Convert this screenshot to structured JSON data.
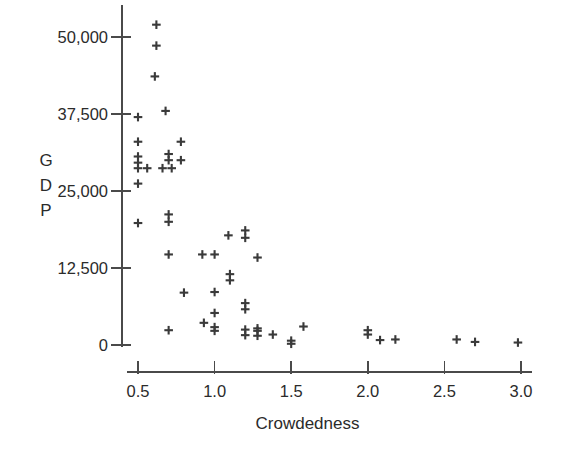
{
  "chart_data": {
    "type": "scatter",
    "title": "",
    "xlabel": "Crowdedness",
    "ylabel": "GDP",
    "ylabel_letters": [
      "G",
      "D",
      "P"
    ],
    "xlim": [
      0.44,
      3.06
    ],
    "ylim": [
      -1600,
      53500
    ],
    "xticks": [
      0.5,
      1.0,
      1.5,
      2.0,
      2.5,
      3.0
    ],
    "xtick_labels": [
      "0.5",
      "1.0",
      "1.5",
      "2.0",
      "2.5",
      "3.0"
    ],
    "yticks": [
      0,
      12500,
      25000,
      37500,
      50000
    ],
    "ytick_labels": [
      "0",
      "12,500",
      "25,000",
      "37,500",
      "50,000"
    ],
    "grid": false,
    "legend": false,
    "marker": "plus",
    "marker_color": "#3a3a3a",
    "axis_color": "#4a4a4a",
    "background": "#ffffff",
    "points": [
      [
        0.62,
        52000
      ],
      [
        0.62,
        48600
      ],
      [
        0.61,
        43600
      ],
      [
        0.5,
        37000
      ],
      [
        0.68,
        38000
      ],
      [
        0.5,
        33000
      ],
      [
        0.78,
        33000
      ],
      [
        0.5,
        30600
      ],
      [
        0.5,
        29600
      ],
      [
        0.7,
        31000
      ],
      [
        0.7,
        30000
      ],
      [
        0.78,
        30000
      ],
      [
        0.5,
        28700
      ],
      [
        0.56,
        28700
      ],
      [
        0.66,
        28700
      ],
      [
        0.72,
        28700
      ],
      [
        0.5,
        26200
      ],
      [
        0.5,
        19800
      ],
      [
        0.7,
        21200
      ],
      [
        0.7,
        20000
      ],
      [
        1.09,
        17800
      ],
      [
        1.2,
        18600
      ],
      [
        1.2,
        17400
      ],
      [
        0.7,
        14700
      ],
      [
        0.92,
        14700
      ],
      [
        1.0,
        14700
      ],
      [
        1.28,
        14200
      ],
      [
        1.1,
        11500
      ],
      [
        1.1,
        10500
      ],
      [
        0.8,
        8500
      ],
      [
        1.0,
        8600
      ],
      [
        1.2,
        6800
      ],
      [
        1.2,
        5800
      ],
      [
        1.0,
        5200
      ],
      [
        0.93,
        3600
      ],
      [
        1.0,
        2900
      ],
      [
        1.0,
        2300
      ],
      [
        1.2,
        2500
      ],
      [
        1.2,
        1600
      ],
      [
        0.7,
        2400
      ],
      [
        1.28,
        2700
      ],
      [
        1.28,
        2300
      ],
      [
        1.28,
        1500
      ],
      [
        1.38,
        1700
      ],
      [
        1.5,
        700
      ],
      [
        1.5,
        200
      ],
      [
        1.58,
        3000
      ],
      [
        2.0,
        2400
      ],
      [
        2.0,
        1700
      ],
      [
        2.08,
        800
      ],
      [
        2.18,
        900
      ],
      [
        2.58,
        900
      ],
      [
        2.7,
        500
      ],
      [
        2.98,
        400
      ]
    ]
  },
  "meta": {
    "point_count": "54"
  }
}
